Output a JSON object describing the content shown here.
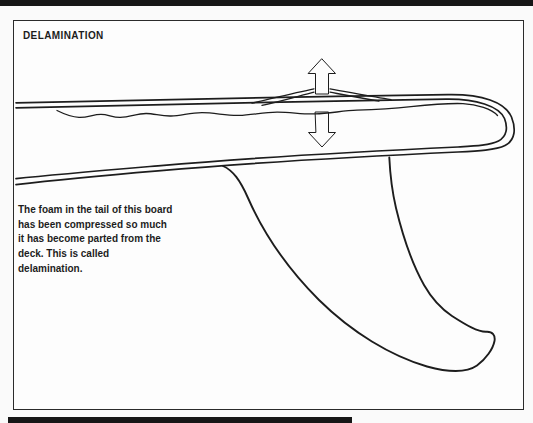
{
  "figure": {
    "title": "DELAMINATION",
    "caption_lines": [
      "The foam in the tail of this board",
      "has been compressed so much",
      "it has become parted from the",
      "deck. This is called",
      "delamination."
    ],
    "illustration_subject": "surfboard-tail-cross-section-with-fin",
    "icons": [
      "arrow-up-icon",
      "arrow-down-icon"
    ]
  },
  "colors": {
    "ink": "#1d1d1d",
    "paper": "#fdfdfd",
    "page_background": "#fafafa",
    "bar_color": "#161616",
    "frame_border": "#2b2b2b",
    "arrow_dark": "#3d3d3d",
    "arrow_light": "#ececec"
  }
}
